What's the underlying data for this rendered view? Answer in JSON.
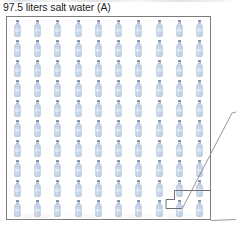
{
  "figure": {
    "caption": "97.5 liters salt water (A)",
    "label": "A",
    "quantity_text": "97.5",
    "unit_text": "liters",
    "substance_text": "salt water"
  },
  "colors": {
    "bottle_body": "#c3d3e8",
    "bottle_body_light": "#e2ebf6",
    "bottle_outline": "#8fa4c0",
    "bottle_cap": "#5a6b82",
    "box_border": "#7d7d7d",
    "callout_line": "#6f6f6f",
    "text": "#1d1d1d",
    "background": "#ffffff"
  },
  "chart_data": {
    "type": "pictograph",
    "title": "97.5 liters salt water (A)",
    "xlabel": "",
    "ylabel": "",
    "icon": "water-bottle",
    "rows": 10,
    "columns": 10,
    "total_icons": 100,
    "icon_unit_value": 1,
    "icon_unit_label": "liter",
    "value": 97.5,
    "value_unit": "liters",
    "series": [
      {
        "name": "salt water (A)",
        "value": 97.5,
        "unit": "liters",
        "icons_full": 100,
        "icons_called_out": 1
      }
    ],
    "annotations": [
      {
        "name": "notch-callout",
        "shape": "stepped-line",
        "description": "Stepped line isolating the final bottle in the bottom row, marking the remaining fractional portion.",
        "target_row": 10,
        "target_column": 8
      },
      {
        "name": "magnifier-leader",
        "shape": "diagonal-leader-lines",
        "description": "Two diagonal leader lines extending from the bottom-right callout toward the right edge of the figure."
      }
    ],
    "grid": false,
    "legend": null,
    "legend_position": null
  },
  "grid": {
    "rows": 10,
    "columns": 10,
    "cells": [
      [
        "bottle",
        "bottle",
        "bottle",
        "bottle",
        "bottle",
        "bottle",
        "bottle",
        "bottle",
        "bottle",
        "bottle"
      ],
      [
        "bottle",
        "bottle",
        "bottle",
        "bottle",
        "bottle",
        "bottle",
        "bottle",
        "bottle",
        "bottle",
        "bottle"
      ],
      [
        "bottle",
        "bottle",
        "bottle",
        "bottle",
        "bottle",
        "bottle",
        "bottle",
        "bottle",
        "bottle",
        "bottle"
      ],
      [
        "bottle",
        "bottle",
        "bottle",
        "bottle",
        "bottle",
        "bottle",
        "bottle",
        "bottle",
        "bottle",
        "bottle"
      ],
      [
        "bottle",
        "bottle",
        "bottle",
        "bottle",
        "bottle",
        "bottle",
        "bottle",
        "bottle",
        "bottle",
        "bottle"
      ],
      [
        "bottle",
        "bottle",
        "bottle",
        "bottle",
        "bottle",
        "bottle",
        "bottle",
        "bottle",
        "bottle",
        "bottle"
      ],
      [
        "bottle",
        "bottle",
        "bottle",
        "bottle",
        "bottle",
        "bottle",
        "bottle",
        "bottle",
        "bottle",
        "bottle"
      ],
      [
        "bottle",
        "bottle",
        "bottle",
        "bottle",
        "bottle",
        "bottle",
        "bottle",
        "bottle",
        "bottle",
        "bottle"
      ],
      [
        "bottle",
        "bottle",
        "bottle",
        "bottle",
        "bottle",
        "bottle",
        "bottle",
        "bottle",
        "bottle",
        "bottle"
      ],
      [
        "bottle",
        "bottle",
        "bottle",
        "bottle",
        "bottle",
        "bottle",
        "bottle",
        "bottle",
        "bottle",
        "bottle"
      ]
    ]
  }
}
